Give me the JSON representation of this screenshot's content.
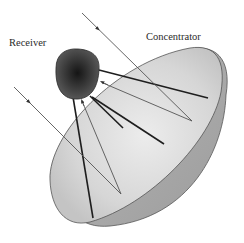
{
  "diagram": {
    "labels": {
      "receiver": "Receiver",
      "concentrator": "Concentrator"
    },
    "components": [
      {
        "id": "receiver",
        "shape": "rounded-square",
        "fill": "radial gradient dark",
        "center_color": "#1a1a1a",
        "edge_color": "#5a5a5a"
      },
      {
        "id": "concentrator",
        "shape": "parabolic dish",
        "inner_color": "#d9d9d9",
        "rim_color": "#a8a8a8"
      },
      {
        "id": "support-struts",
        "count": 4,
        "color": "#1e1e1e"
      }
    ],
    "rays": [
      {
        "id": "incident-ray-1",
        "direction": "in",
        "from": [
          82,
          13
        ],
        "to": [
          192,
          121
        ]
      },
      {
        "id": "incident-ray-2",
        "direction": "in",
        "from": [
          14,
          87
        ],
        "to": [
          121,
          194
        ]
      },
      {
        "id": "reflected-ray-1",
        "direction": "to-receiver",
        "from": [
          192,
          121
        ],
        "to": [
          101,
          83
        ]
      },
      {
        "id": "reflected-ray-2",
        "direction": "to-receiver",
        "from": [
          121,
          194
        ],
        "to": [
          81,
          101
        ]
      }
    ],
    "colors": {
      "background": "#ffffff",
      "ray": "#555555",
      "strut": "#1e1e1e",
      "text": "#2a2a2a"
    }
  }
}
